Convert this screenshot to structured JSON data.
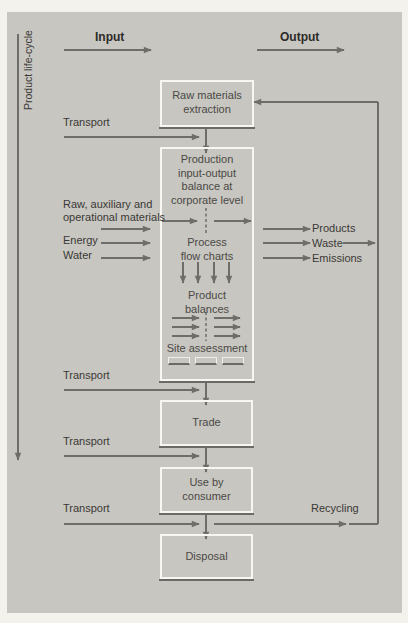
{
  "diagram": {
    "side_label": "Product life-cycle",
    "header": {
      "input": "Input",
      "output": "Output"
    },
    "stages": {
      "raw_materials": "Raw materials extraction",
      "raw_materials_lines": [
        "Raw materials",
        "extraction"
      ],
      "production": {
        "title_lines": [
          "Production",
          "input-output",
          "balance at",
          "corporate level"
        ],
        "process_lines": [
          "Process",
          "flow charts"
        ],
        "product_balance_lines": [
          "Product",
          "balances"
        ],
        "site_assessment": "Site assessment"
      },
      "trade": "Trade",
      "use_lines": [
        "Use by",
        "consumer"
      ],
      "disposal": "Disposal"
    },
    "inputs": {
      "transport_1": "Transport",
      "materials_lines": [
        "Raw, auxiliary and",
        "operational materials"
      ],
      "energy": "Energy",
      "water": "Water",
      "transport_2": "Transport",
      "transport_3": "Transport",
      "transport_4": "Transport"
    },
    "outputs": {
      "products": "Products",
      "waste": "Waste",
      "emissions": "Emissions",
      "recycling": "Recycling"
    },
    "colors": {
      "background": "#f4f2ec",
      "panel": "#c8c6c0",
      "arrow": "#6e6d69",
      "box_border": "#f7f6f2",
      "text": "#3a3937"
    }
  }
}
